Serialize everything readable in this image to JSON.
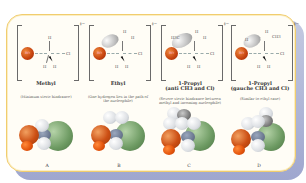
{
  "figure": {
    "panels": [
      {
        "title": "Methyl",
        "note": "(Minimum steric hindrance)",
        "charge": "‡−",
        "nucleophile": "HO",
        "leaving_group": "Cl",
        "substituents": [
          "H",
          "H",
          "H"
        ],
        "space_filling_label": "A"
      },
      {
        "title": "Ethyl",
        "note": "(One hydrogen lies in the path of the nucleophile)",
        "charge": "‡−",
        "nucleophile": "HO",
        "leaving_group": "Cl",
        "substituents": [
          "H",
          "H",
          "H",
          "H",
          "H"
        ],
        "space_filling_label": "B"
      },
      {
        "title": "1-Propyl",
        "subtitle": "(anti CH3 and Cl)",
        "note": "(Severe steric hindrance between methyl and incoming nucleophile)",
        "charge": "‡−",
        "nucleophile": "HO",
        "leaving_group": "Cl",
        "substituents": [
          "H3C",
          "H",
          "H",
          "H",
          "H"
        ],
        "space_filling_label": "C"
      },
      {
        "title": "1-Propyl",
        "subtitle": "(gauche CH3 and Cl)",
        "note": "(Similar to ethyl case)",
        "charge": "‡−",
        "nucleophile": "HO",
        "leaving_group": "Cl",
        "substituents": [
          "H",
          "H",
          "CH3",
          "H",
          "H"
        ],
        "space_filling_label": "D"
      }
    ],
    "colors": {
      "frame_border": "#f1cd6e",
      "frame_fill": "#fffdf6",
      "shadow": "#8e97c6",
      "oxygen": "#cc4f14",
      "chlorine": "#6d9a62",
      "hydrogen": "#dcdfe3",
      "carbon": "#6d7a92"
    }
  }
}
